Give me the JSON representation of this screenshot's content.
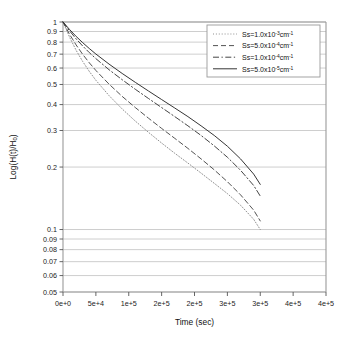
{
  "chart_data": {
    "type": "line",
    "title": "",
    "xlabel": "Time (sec)",
    "ylabel": "Log(H(t)/H0)",
    "ylabel_display": "Log(H(t)/H",
    "ylabel_sub": "0",
    "ylabel_tail": ")",
    "xlim": [
      0,
      400000
    ],
    "ylim": [
      0.05,
      1
    ],
    "yscale": "log",
    "xscale": "linear",
    "grid": "horizontal",
    "legend_position": "upper right",
    "xticks": [
      0,
      50000,
      100000,
      150000,
      200000,
      250000,
      300000,
      350000,
      400000
    ],
    "xticklabels": [
      "0e+0",
      "5e+4",
      "1e+5",
      "2e+5",
      "2e+5",
      "3e+5",
      "3e+5",
      "4e+5",
      "4e+5"
    ],
    "yticks": [
      1,
      0.9,
      0.8,
      0.7,
      0.6,
      0.5,
      0.4,
      0.3,
      0.2,
      0.1,
      0.09,
      0.08,
      0.07,
      0.06,
      0.05
    ],
    "yticklabels": [
      "1",
      "0.9",
      "0.8",
      "0.7",
      "0.6",
      "0.5",
      "0.4",
      "0.3",
      "0.2",
      "0.1",
      "0.09",
      "0.08",
      "0.07",
      "0.06",
      "0.05"
    ],
    "series": [
      {
        "name": "Ss=1.0x10-3cm-1",
        "label_prefix": "Ss=1.0x10",
        "label_exp": "-3",
        "label_unit": "cm",
        "label_unit_exp": "-1",
        "style": "dotted",
        "color": "#8a8a8a",
        "x": [
          0,
          10000,
          20000,
          30000,
          40000,
          50000,
          70000,
          90000,
          110000,
          130000,
          150000,
          170000,
          190000,
          210000,
          230000,
          250000,
          270000,
          290000,
          300000
        ],
        "y": [
          1.0,
          0.845,
          0.73,
          0.645,
          0.578,
          0.524,
          0.442,
          0.381,
          0.333,
          0.294,
          0.261,
          0.233,
          0.209,
          0.187,
          0.167,
          0.149,
          0.131,
          0.112,
          0.1
        ]
      },
      {
        "name": "Ss=5.0x10-4cm-1",
        "label_prefix": "Ss=5.0x10",
        "label_exp": "-4",
        "label_unit": "cm",
        "label_unit_exp": "-1",
        "style": "dashed",
        "color": "#4a4a4a",
        "x": [
          0,
          10000,
          20000,
          30000,
          40000,
          50000,
          70000,
          90000,
          110000,
          130000,
          150000,
          170000,
          190000,
          210000,
          230000,
          250000,
          270000,
          290000,
          300000
        ],
        "y": [
          1.0,
          0.872,
          0.775,
          0.698,
          0.636,
          0.584,
          0.502,
          0.438,
          0.387,
          0.344,
          0.307,
          0.275,
          0.246,
          0.219,
          0.194,
          0.17,
          0.147,
          0.124,
          0.11
        ]
      },
      {
        "name": "Ss=1.0x10-4cm-1",
        "label_prefix": "Ss=1.0x10",
        "label_exp": "-4",
        "label_unit": "cm",
        "label_unit_exp": "-1",
        "style": "dashdot",
        "color": "#3a3a3a",
        "x": [
          0,
          10000,
          20000,
          30000,
          40000,
          50000,
          70000,
          90000,
          110000,
          130000,
          150000,
          170000,
          190000,
          210000,
          230000,
          250000,
          270000,
          290000,
          300000
        ],
        "y": [
          1.0,
          0.906,
          0.829,
          0.766,
          0.712,
          0.666,
          0.589,
          0.527,
          0.474,
          0.428,
          0.387,
          0.35,
          0.316,
          0.284,
          0.253,
          0.223,
          0.193,
          0.163,
          0.145
        ]
      },
      {
        "name": "Ss=5.0x10-5cm-1",
        "label_prefix": "Ss=5.0x10",
        "label_exp": "-5",
        "label_unit": "cm",
        "label_unit_exp": "-1",
        "style": "solid",
        "color": "#2a2a2a",
        "x": [
          0,
          10000,
          20000,
          30000,
          40000,
          50000,
          70000,
          90000,
          110000,
          130000,
          150000,
          170000,
          190000,
          210000,
          230000,
          250000,
          270000,
          290000,
          300000
        ],
        "y": [
          1.0,
          0.92,
          0.852,
          0.795,
          0.745,
          0.701,
          0.627,
          0.565,
          0.512,
          0.465,
          0.423,
          0.385,
          0.35,
          0.316,
          0.284,
          0.252,
          0.219,
          0.185,
          0.165
        ]
      }
    ],
    "annotations": []
  },
  "legend": {
    "entries": [
      {
        "index": 0
      },
      {
        "index": 1
      },
      {
        "index": 2
      },
      {
        "index": 3
      }
    ]
  },
  "style": {
    "frame_color": "#9a9a9a",
    "grid_color": "#b9b9b9",
    "background": "#ffffff"
  }
}
